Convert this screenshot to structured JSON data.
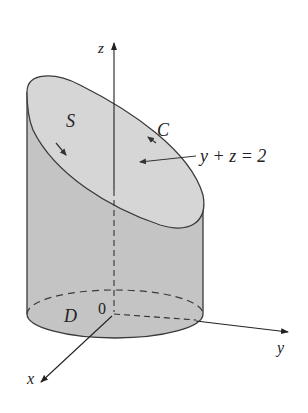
{
  "figure": {
    "labels": {
      "z_axis": "z",
      "y_axis": "y",
      "x_axis": "x",
      "origin": "0",
      "surface": "S",
      "curve": "C",
      "plane_equation": "y + z = 2",
      "region": "D"
    },
    "colors": {
      "surface_fill": "#d6d6d6",
      "side_fill": "#c2c2c2",
      "base_fill": "#cfcfcf",
      "stroke": "#3a3a3a",
      "text": "#222222"
    }
  }
}
